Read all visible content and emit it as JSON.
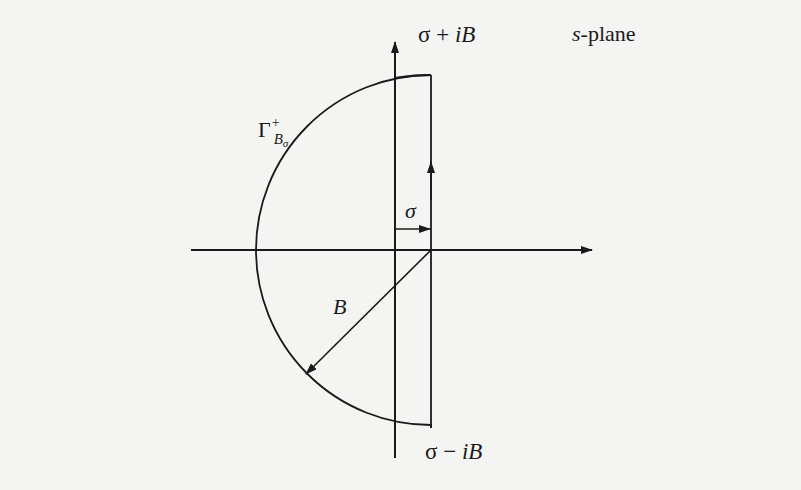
{
  "diagram": {
    "title": "s-plane",
    "plane_label": {
      "prefix": "s",
      "suffix": "-plane"
    },
    "labels": {
      "top_point": {
        "sigma": "σ",
        "op": " + ",
        "i": "i",
        "B": "B"
      },
      "bottom_point": {
        "sigma": "σ",
        "op": " − ",
        "i": "i",
        "B": "B"
      },
      "contour": {
        "symbol": "Γ",
        "superscript": "+",
        "subscript_main": "B",
        "subscript_sub": "σ"
      },
      "sigma_offset": "σ",
      "radius": "B"
    },
    "elements": [
      {
        "type": "axis",
        "name": "real-axis",
        "from": [
          191,
          250
        ],
        "to": [
          592,
          250
        ],
        "arrow": "end"
      },
      {
        "type": "axis",
        "name": "imaginary-axis",
        "from": [
          395,
          458
        ],
        "to": [
          395,
          42
        ],
        "arrow": "end"
      },
      {
        "type": "contour",
        "name": "gamma-contour",
        "center": [
          431,
          250
        ],
        "radius": 175,
        "vertical_edge_x": 431,
        "direction": "upward on right edge"
      },
      {
        "type": "arrow",
        "name": "sigma-arrow",
        "from": [
          395,
          228
        ],
        "to": [
          431,
          228
        ]
      },
      {
        "type": "arrow",
        "name": "radius-B-arrow",
        "from": [
          431,
          250
        ],
        "to": [
          305,
          374
        ]
      }
    ],
    "colors": {
      "stroke": "#1a1a1a",
      "background": "#f4f4f2"
    }
  }
}
